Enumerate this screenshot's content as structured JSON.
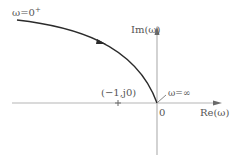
{
  "diagram": {
    "type": "nyquist-plot",
    "colors": {
      "axis": "#b5b5b5",
      "curve": "#2b2b2b",
      "text": "#555555",
      "background": "#ffffff"
    },
    "labels": {
      "omega_start": "ω=0",
      "omega_start_sup": "+",
      "omega_end": "ω=∞",
      "imag_axis": "Im(ω)",
      "real_axis": "Re(ω)",
      "origin": "0",
      "critical_point": "(−1,j0)"
    }
  }
}
